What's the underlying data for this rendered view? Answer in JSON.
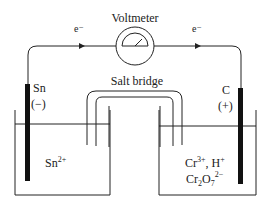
{
  "diagram": {
    "voltmeter": {
      "label": "Voltmeter"
    },
    "electron_flow": {
      "left_label": "e⁻",
      "right_label": "e⁻",
      "direction": "left-to-right"
    },
    "salt_bridge": {
      "label": "Salt bridge"
    },
    "left_half_cell": {
      "electrode": "Sn",
      "polarity": "(−)",
      "solution": {
        "species": "Sn",
        "charge": "2+"
      }
    },
    "right_half_cell": {
      "electrode": "C",
      "polarity": "(+)",
      "solution": {
        "line1": {
          "ion1": "Cr",
          "ion1_charge": "3+",
          "separator": ", ",
          "ion2": "H",
          "ion2_charge": "+"
        },
        "line2": {
          "base": "Cr",
          "sub1": "2",
          "mid": "O",
          "sub2": "7",
          "charge": "2−"
        }
      }
    },
    "colors": {
      "line": "#222222",
      "electrode": "#111111",
      "background": "#ffffff"
    }
  }
}
